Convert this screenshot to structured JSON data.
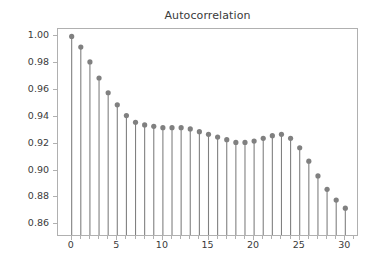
{
  "chart_data": {
    "type": "scatter",
    "plot_style": "stem",
    "title": "Autocorrelation",
    "xlabel": "",
    "ylabel": "",
    "x": [
      0,
      1,
      2,
      3,
      4,
      5,
      6,
      7,
      8,
      9,
      10,
      11,
      12,
      13,
      14,
      15,
      16,
      17,
      18,
      19,
      20,
      21,
      22,
      23,
      24,
      25,
      26,
      27,
      28,
      29,
      30
    ],
    "values": [
      1.0,
      0.992,
      0.981,
      0.969,
      0.958,
      0.949,
      0.941,
      0.936,
      0.934,
      0.933,
      0.932,
      0.932,
      0.932,
      0.931,
      0.929,
      0.927,
      0.925,
      0.923,
      0.921,
      0.921,
      0.922,
      0.924,
      0.926,
      0.927,
      0.924,
      0.917,
      0.907,
      0.896,
      0.886,
      0.878,
      0.872
    ],
    "xlim": [
      -1.5,
      31.5
    ],
    "ylim": [
      0.8505,
      1.0055
    ],
    "ytick_labels": [
      "0.86",
      "0.88",
      "0.90",
      "0.92",
      "0.94",
      "0.96",
      "0.98",
      "1.00"
    ],
    "ytick_values": [
      0.86,
      0.88,
      0.9,
      0.92,
      0.94,
      0.96,
      0.98,
      1.0
    ],
    "xtick_labels": [
      "0",
      "5",
      "10",
      "15",
      "20",
      "25",
      "30"
    ],
    "xtick_values": [
      0,
      5,
      10,
      15,
      20,
      25,
      30
    ],
    "xminor_values": [
      1,
      2,
      3,
      4,
      6,
      7,
      8,
      9,
      11,
      12,
      13,
      14,
      16,
      17,
      18,
      19,
      21,
      22,
      23,
      24,
      26,
      27,
      28,
      29,
      31
    ],
    "grid": false,
    "legend": null,
    "colors": {
      "marker": "#808080",
      "stem": "#808080",
      "axis": "#b0b0b0",
      "text": "#3a3a3a",
      "background": "#ffffff"
    },
    "marker_radius": 2.6,
    "stem_width": 1.1,
    "stem_baseline": 0.8
  }
}
